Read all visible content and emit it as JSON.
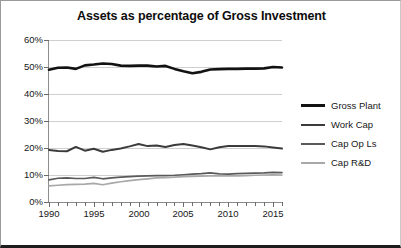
{
  "chart_data": {
    "type": "line",
    "title": "Assets as percentage of Gross Investment",
    "xlabel": "",
    "ylabel": "",
    "xlim": [
      1990,
      2016
    ],
    "ylim": [
      0,
      60
    ],
    "grid": true,
    "legend_position": "right",
    "ytick_labels": [
      "60%",
      "50%",
      "40%",
      "30%",
      "20%",
      "10%",
      "0%"
    ],
    "ytick_values": [
      60,
      50,
      40,
      30,
      20,
      10,
      0
    ],
    "xtick_labels": [
      "1990",
      "1995",
      "2000",
      "2005",
      "2010",
      "2015"
    ],
    "xtick_values": [
      1990,
      1995,
      2000,
      2005,
      2010,
      2015
    ],
    "x": [
      1990,
      1991,
      1992,
      1993,
      1994,
      1995,
      1996,
      1997,
      1998,
      1999,
      2000,
      2001,
      2002,
      2003,
      2004,
      2005,
      2006,
      2007,
      2008,
      2009,
      2010,
      2011,
      2012,
      2013,
      2014,
      2015,
      2016
    ],
    "series": [
      {
        "name": "Gross Plant",
        "color": "#121212",
        "width": 2.6,
        "values": [
          49.0,
          49.7,
          49.8,
          49.3,
          50.6,
          50.9,
          51.3,
          51.1,
          50.5,
          50.4,
          50.5,
          50.5,
          50.2,
          50.4,
          49.3,
          48.4,
          47.7,
          48.2,
          49.1,
          49.2,
          49.3,
          49.3,
          49.4,
          49.4,
          49.5,
          50.0,
          49.8
        ]
      },
      {
        "name": "Work Cap",
        "color": "#3b3b3b",
        "width": 2.0,
        "values": [
          19.3,
          18.9,
          18.8,
          20.4,
          19.0,
          19.7,
          18.6,
          19.3,
          19.8,
          20.6,
          21.5,
          20.7,
          20.9,
          20.4,
          21.1,
          21.5,
          20.9,
          20.3,
          19.5,
          20.3,
          20.7,
          20.7,
          20.7,
          20.7,
          20.6,
          20.2,
          19.8
        ]
      },
      {
        "name": "Cap Op Ls",
        "color": "#5a5a5a",
        "width": 1.7,
        "values": [
          8.2,
          8.8,
          8.9,
          8.7,
          8.7,
          9.1,
          8.6,
          8.9,
          9.2,
          9.4,
          9.6,
          9.7,
          9.8,
          9.8,
          9.9,
          10.1,
          10.3,
          10.5,
          10.8,
          10.4,
          10.3,
          10.5,
          10.6,
          10.7,
          10.8,
          11.0,
          10.9
        ]
      },
      {
        "name": "Cap R&D",
        "color": "#a8a8a8",
        "width": 1.7,
        "values": [
          6.0,
          6.2,
          6.4,
          6.5,
          6.6,
          6.9,
          6.4,
          7.0,
          7.5,
          7.9,
          8.3,
          8.6,
          8.9,
          9.0,
          9.2,
          9.4,
          9.5,
          9.6,
          9.7,
          9.8,
          9.7,
          9.7,
          9.8,
          9.9,
          10.0,
          10.1,
          10.0
        ]
      }
    ]
  }
}
